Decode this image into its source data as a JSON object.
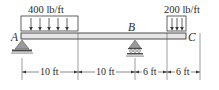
{
  "diagram": {
    "type": "beam-loading",
    "points": [
      {
        "id": "A",
        "label": "A",
        "support": "pin"
      },
      {
        "id": "B",
        "label": "B",
        "support": "roller"
      },
      {
        "id": "C",
        "label": "C",
        "support": "free"
      }
    ],
    "loads": [
      {
        "label": "400 lb/ft",
        "type": "distributed",
        "from": "A",
        "span_ft": 10,
        "arrows": 5
      },
      {
        "label": "200 lb/ft",
        "type": "distributed",
        "to": "C",
        "span_ft": 6,
        "arrows": 3
      }
    ],
    "dimensions": [
      {
        "label": "10 ft"
      },
      {
        "label": "10 ft"
      },
      {
        "label": "6 ft"
      },
      {
        "label": "6 ft"
      }
    ],
    "colors": {
      "line": "#3a3a3a",
      "beam_fill": "#e6e6e6",
      "support_fill": "#9a9a9a",
      "support_dark": "#4a4a4a"
    }
  }
}
